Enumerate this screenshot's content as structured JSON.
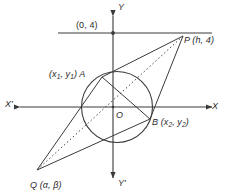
{
  "figure": {
    "type": "geometry-diagram",
    "colors": {
      "stroke": "#3a3a3a",
      "text": "#2b2b2b",
      "background": "#ffffff"
    },
    "axes": {
      "x_positive_label": "X",
      "x_negative_label": "X'",
      "y_positive_label": "Y",
      "y_negative_label": "Y'",
      "origin_label": "O"
    },
    "points": [
      {
        "key": "P",
        "label": "P (h, 4)",
        "name_part": "P",
        "coords_part": " (h, 4)"
      },
      {
        "key": "Q",
        "label": "Q (α, β)",
        "name_part": "Q",
        "coords_part": " (α, β)"
      },
      {
        "key": "A",
        "label": "(x1, y1) A"
      },
      {
        "key": "B",
        "label": "B (x2, y2)"
      },
      {
        "key": "line_y4",
        "label": "(0, 4)"
      }
    ],
    "labels": {
      "y_eq_4": "(0, 4)",
      "point_p": "P (h, 4)",
      "point_q": "Q (α, β)",
      "point_a_prefix": "(x",
      "point_a_sub1": "1",
      "point_a_mid": ", y",
      "point_a_sub2": "1",
      "point_a_suffix": ") A",
      "point_b_prefix": "B (x",
      "point_b_sub1": "2",
      "point_b_mid": ", y",
      "point_b_sub2": "2",
      "point_b_suffix": ")",
      "origin": "O",
      "x_axis": "X",
      "x_axis_neg": "X'",
      "y_axis": "Y",
      "y_axis_neg": "Y'"
    }
  }
}
